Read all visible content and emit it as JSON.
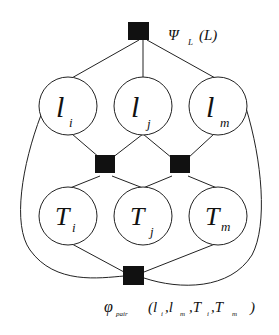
{
  "diagram": {
    "type": "factor-graph",
    "top_factor": {
      "label_main": "Ψ",
      "label_sub": "L",
      "label_args": "(L)"
    },
    "bottom_factor": {
      "label_main": "φ",
      "label_sub": "pair",
      "label_args": "(l",
      "args": [
        "l_i",
        "l_m",
        "T_i",
        "T_m"
      ]
    },
    "l_nodes": [
      {
        "main": "l",
        "sub": "i"
      },
      {
        "main": "l",
        "sub": "j"
      },
      {
        "main": "l",
        "sub": "m"
      }
    ],
    "t_nodes": [
      {
        "main": "T",
        "sub": "i"
      },
      {
        "main": "T",
        "sub": "j"
      },
      {
        "main": "T",
        "sub": "m"
      }
    ],
    "pair_factor_text": {
      "p1": "(l",
      "s1": "i",
      "c1": ",l",
      "s2": "m",
      "c2": ",T",
      "s3": "i",
      "c3": ",T",
      "s4": "m",
      "close": ")"
    },
    "colors": {
      "line": "#222222",
      "factor": "#111111",
      "background": "#ffffff"
    }
  }
}
